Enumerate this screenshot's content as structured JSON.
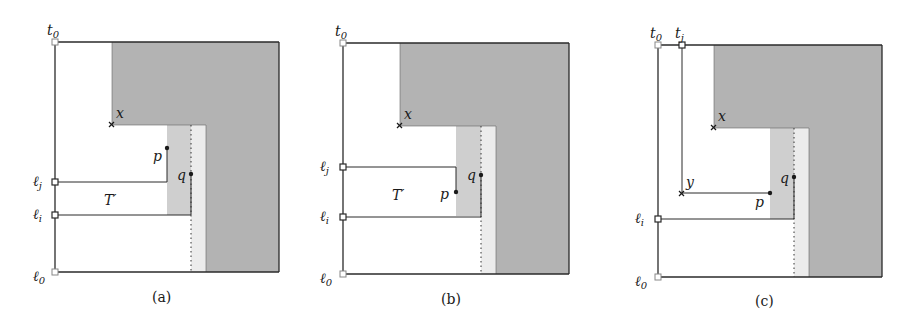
{
  "colors": {
    "dark_gray": "#b3b3b3",
    "mid_gray": "#cfcfcf",
    "light_gray": "#ececec",
    "stroke": "#2a2a2a"
  },
  "panels": [
    {
      "caption": "(a)",
      "labels": {
        "t0": "t",
        "t0_sub": "0",
        "l0": "ℓ",
        "l0_sub": "0",
        "lj": "ℓ",
        "lj_sub": "j",
        "li": "ℓ",
        "li_sub": "i",
        "x": "x",
        "p": "p",
        "q": "q",
        "T": "T′"
      }
    },
    {
      "caption": "(b)",
      "labels": {
        "t0": "t",
        "t0_sub": "0",
        "l0": "ℓ",
        "l0_sub": "0",
        "lj": "ℓ",
        "lj_sub": "j",
        "li": "ℓ",
        "li_sub": "i",
        "x": "x",
        "p": "p",
        "q": "q",
        "T": "T′"
      }
    },
    {
      "caption": "(c)",
      "labels": {
        "t0": "t",
        "t0_sub": "0",
        "tj": "t",
        "tj_sub": "j",
        "l0": "ℓ",
        "l0_sub": "0",
        "li": "ℓ",
        "li_sub": "i",
        "x": "x",
        "y": "y",
        "p": "p",
        "q": "q"
      }
    }
  ]
}
